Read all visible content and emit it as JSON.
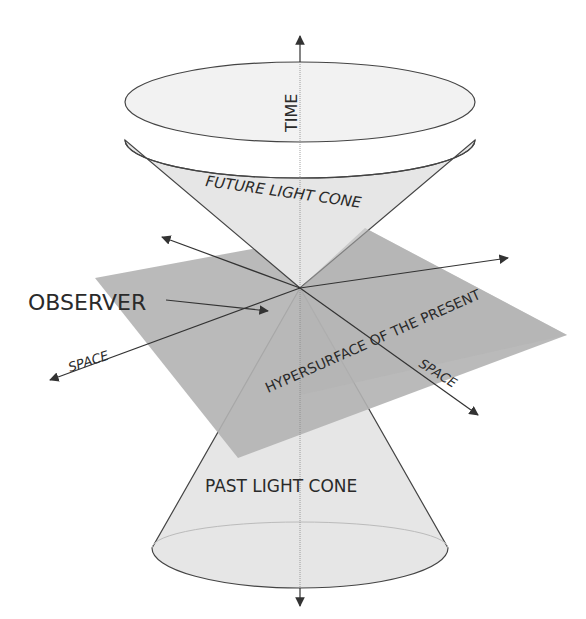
{
  "diagram": {
    "type": "spacetime-light-cone",
    "labels": {
      "time_axis": "TIME",
      "future_cone": "FUTURE LIGHT CONE",
      "past_cone": "PAST LIGHT CONE",
      "observer": "OBSERVER",
      "plane": "HYPERSURFACE OF THE PRESENT",
      "space_left": "SPACE",
      "space_right": "SPACE"
    },
    "colors": {
      "cone_fill": "#e6e6e6",
      "cone_rim_fill": "#f0f0f0",
      "plane_fill": "#b3b3b3",
      "stroke": "#333333",
      "text": "#2a2a2a"
    }
  }
}
